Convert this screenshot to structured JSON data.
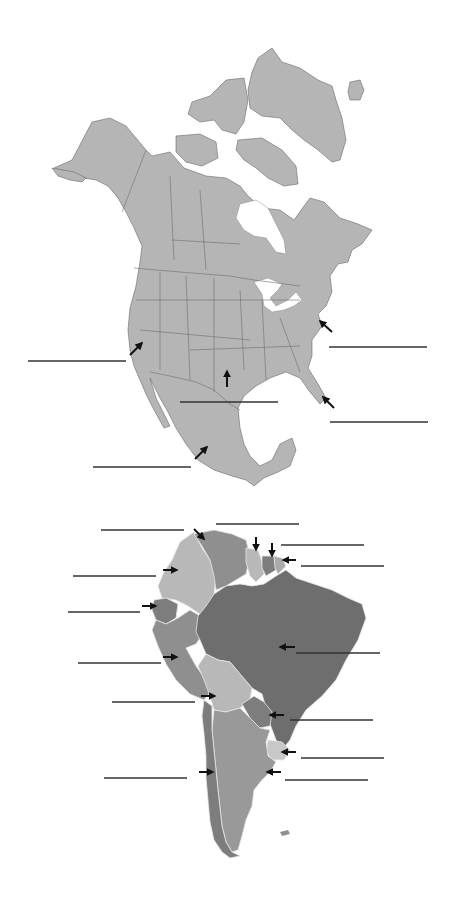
{
  "worksheet": {
    "type": "map-labeling",
    "background": "#ffffff"
  },
  "maps": [
    {
      "name": "north-america",
      "fill_color": "#b5b5b5",
      "border_color": "#6e6e6e",
      "answer_lines": [
        {
          "id": "na-line-1",
          "x1": 28,
          "y1": 361,
          "x2": 126,
          "y2": 361
        },
        {
          "id": "na-line-2",
          "x1": 329,
          "y1": 347,
          "x2": 427,
          "y2": 347
        },
        {
          "id": "na-line-3",
          "x1": 180,
          "y1": 402,
          "x2": 278,
          "y2": 402
        },
        {
          "id": "na-line-4",
          "x1": 330,
          "y1": 422,
          "x2": 428,
          "y2": 422
        },
        {
          "id": "na-line-5",
          "x1": 93,
          "y1": 467,
          "x2": 191,
          "y2": 467
        }
      ],
      "arrows": [
        {
          "id": "na-arrow-west-coast",
          "x1": 130,
          "y1": 355,
          "x2": 142,
          "y2": 343
        },
        {
          "id": "na-arrow-east-coast",
          "x1": 332,
          "y1": 332,
          "x2": 320,
          "y2": 321
        },
        {
          "id": "na-arrow-central",
          "x1": 227,
          "y1": 387,
          "x2": 227,
          "y2": 371
        },
        {
          "id": "na-arrow-florida",
          "x1": 334,
          "y1": 408,
          "x2": 323,
          "y2": 397
        },
        {
          "id": "na-arrow-mexico",
          "x1": 195,
          "y1": 459,
          "x2": 207,
          "y2": 447
        }
      ]
    },
    {
      "name": "south-america",
      "colors": {
        "dark": "#6e6e6e",
        "medium": "#8f8f8f",
        "light": "#b8b8b8",
        "mid_dark": "#7d7d7d"
      },
      "answer_lines": [
        {
          "id": "sa-line-1",
          "x1": 101,
          "y1": 530,
          "x2": 184,
          "y2": 530
        },
        {
          "id": "sa-line-2",
          "x1": 216,
          "y1": 524,
          "x2": 299,
          "y2": 524
        },
        {
          "id": "sa-line-3",
          "x1": 281,
          "y1": 545,
          "x2": 364,
          "y2": 545
        },
        {
          "id": "sa-line-4",
          "x1": 301,
          "y1": 566,
          "x2": 384,
          "y2": 566
        },
        {
          "id": "sa-line-5",
          "x1": 73,
          "y1": 576,
          "x2": 156,
          "y2": 576
        },
        {
          "id": "sa-line-6",
          "x1": 68,
          "y1": 612,
          "x2": 140,
          "y2": 612
        },
        {
          "id": "sa-line-7",
          "x1": 296,
          "y1": 653,
          "x2": 380,
          "y2": 653
        },
        {
          "id": "sa-line-8",
          "x1": 78,
          "y1": 663,
          "x2": 161,
          "y2": 663
        },
        {
          "id": "sa-line-9",
          "x1": 112,
          "y1": 702,
          "x2": 195,
          "y2": 702
        },
        {
          "id": "sa-line-10",
          "x1": 290,
          "y1": 720,
          "x2": 373,
          "y2": 720
        },
        {
          "id": "sa-line-11",
          "x1": 301,
          "y1": 758,
          "x2": 384,
          "y2": 758
        },
        {
          "id": "sa-line-12",
          "x1": 104,
          "y1": 778,
          "x2": 187,
          "y2": 778
        },
        {
          "id": "sa-line-13",
          "x1": 285,
          "y1": 780,
          "x2": 368,
          "y2": 780
        }
      ],
      "arrows": [
        {
          "id": "sa-arrow-venezuela",
          "x1": 194,
          "y1": 529,
          "x2": 204,
          "y2": 539
        },
        {
          "id": "sa-arrow-guyana",
          "x1": 256,
          "y1": 537,
          "x2": 256,
          "y2": 550
        },
        {
          "id": "sa-arrow-suriname",
          "x1": 272,
          "y1": 543,
          "x2": 272,
          "y2": 556
        },
        {
          "id": "sa-arrow-french-guiana",
          "x1": 296,
          "y1": 560,
          "x2": 283,
          "y2": 560
        },
        {
          "id": "sa-arrow-colombia",
          "x1": 163,
          "y1": 570,
          "x2": 177,
          "y2": 570
        },
        {
          "id": "sa-arrow-ecuador",
          "x1": 142,
          "y1": 606,
          "x2": 156,
          "y2": 606
        },
        {
          "id": "sa-arrow-brazil",
          "x1": 295,
          "y1": 647,
          "x2": 280,
          "y2": 647
        },
        {
          "id": "sa-arrow-peru",
          "x1": 163,
          "y1": 657,
          "x2": 177,
          "y2": 657
        },
        {
          "id": "sa-arrow-bolivia",
          "x1": 201,
          "y1": 696,
          "x2": 215,
          "y2": 696
        },
        {
          "id": "sa-arrow-paraguay",
          "x1": 284,
          "y1": 715,
          "x2": 270,
          "y2": 715
        },
        {
          "id": "sa-arrow-uruguay",
          "x1": 296,
          "y1": 752,
          "x2": 282,
          "y2": 752
        },
        {
          "id": "sa-arrow-chile",
          "x1": 199,
          "y1": 772,
          "x2": 213,
          "y2": 772
        },
        {
          "id": "sa-arrow-argentina",
          "x1": 281,
          "y1": 772,
          "x2": 267,
          "y2": 772
        }
      ]
    }
  ]
}
